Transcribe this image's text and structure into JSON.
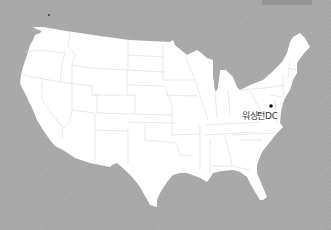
{
  "map": {
    "region": "Contiguous United States",
    "colors": {
      "background": "#a9a9a9",
      "land": "#ffffff",
      "borders": "#d6d6d6",
      "marker": "#111111"
    },
    "markers": [
      {
        "label": "워싱턴DC",
        "x": 271,
        "y": 106
      }
    ]
  }
}
